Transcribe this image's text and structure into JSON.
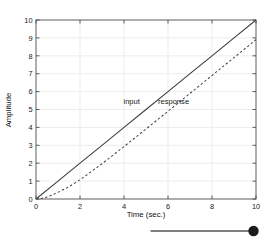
{
  "figure": {
    "background_color": "#ffffff",
    "axes_color": "#4d4d4d",
    "grid_color": "#e8e8ea",
    "text_color": "#1a1a1a"
  },
  "chart_data": {
    "type": "line",
    "title": "",
    "xlabel": "Time (sec.)",
    "ylabel": "Amplitude",
    "xlim": [
      0,
      10
    ],
    "ylim": [
      0,
      10
    ],
    "xticks": [
      0,
      2,
      4,
      6,
      8,
      10
    ],
    "xticklabels": [
      "0",
      "2",
      "4",
      "6",
      "8",
      "10"
    ],
    "yticks": [
      0,
      1,
      2,
      3,
      4,
      5,
      6,
      7,
      8,
      9,
      10
    ],
    "yticklabels": [
      "0",
      "1",
      "2",
      "3",
      "4",
      "5",
      "6",
      "7",
      "8",
      "9",
      "10"
    ],
    "grid": true,
    "legend": "inline-annotations",
    "annotations": [
      {
        "text": "input",
        "x": 4.35,
        "y": 5.3
      },
      {
        "text": "response",
        "x": 6.25,
        "y": 5.3
      }
    ],
    "series": [
      {
        "name": "input",
        "style": "solid",
        "color": "#3a3a3a",
        "x": [
          0,
          1,
          2,
          3,
          4,
          5,
          6,
          7,
          8,
          9,
          10
        ],
        "values": [
          0,
          1,
          2,
          3,
          4,
          5,
          6,
          7,
          8,
          9,
          10
        ]
      },
      {
        "name": "response",
        "style": "dashed",
        "color": "#4a4a4a",
        "x": [
          0,
          0.25,
          0.5,
          0.75,
          1,
          1.5,
          2,
          3,
          4,
          5,
          6,
          7,
          8,
          9,
          10
        ],
        "values": [
          0,
          0.03,
          0.11,
          0.23,
          0.37,
          0.69,
          1.07,
          1.97,
          2.93,
          3.91,
          4.9,
          5.9,
          6.9,
          7.9,
          8.9
        ]
      }
    ]
  },
  "page_artifact": {
    "name": "pointer-line-with-dot",
    "line_color": "#555555",
    "dot_color": "#1c1c1c"
  }
}
